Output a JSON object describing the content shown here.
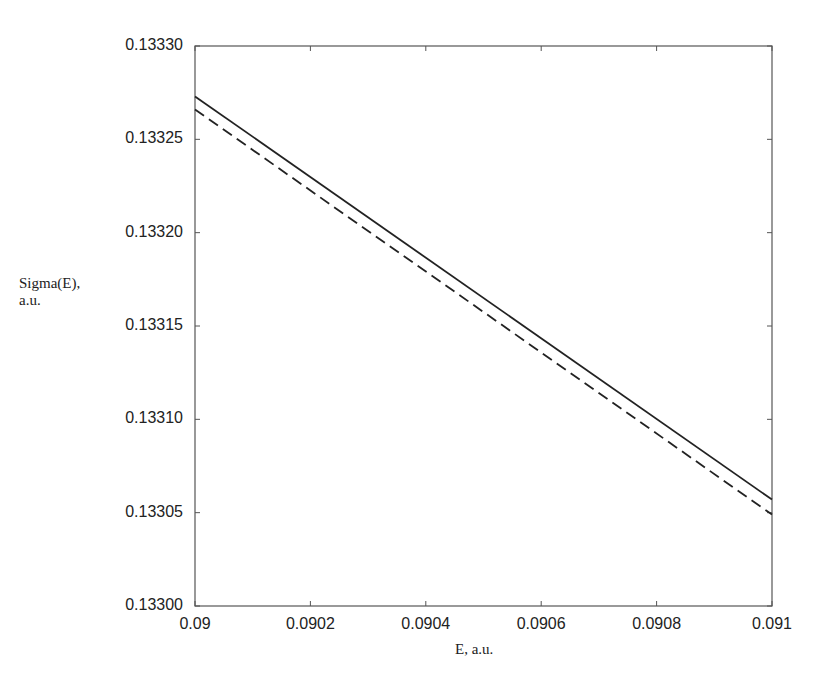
{
  "chart_data": {
    "type": "line",
    "title": "",
    "xlabel": "E, a.u.",
    "ylabel": "Sigma(E), a.u.",
    "ylabel_lines": [
      "Sigma(E),",
      "a.u."
    ],
    "xlim": [
      0.09,
      0.091
    ],
    "ylim": [
      0.133,
      0.1333
    ],
    "x_ticks": [
      "0.09",
      "0.0902",
      "0.0904",
      "0.0906",
      "0.0908",
      "0.091"
    ],
    "y_ticks": [
      "0.13300",
      "0.13305",
      "0.13310",
      "0.13315",
      "0.13320",
      "0.13325",
      "0.13330"
    ],
    "grid": false,
    "legend": null,
    "series": [
      {
        "name": "solid",
        "style": "solid",
        "x": [
          0.09,
          0.091
        ],
        "y": [
          0.133273,
          0.133057
        ]
      },
      {
        "name": "dashed",
        "style": "dashed",
        "x": [
          0.09,
          0.091
        ],
        "y": [
          0.133266,
          0.133049
        ]
      }
    ]
  }
}
